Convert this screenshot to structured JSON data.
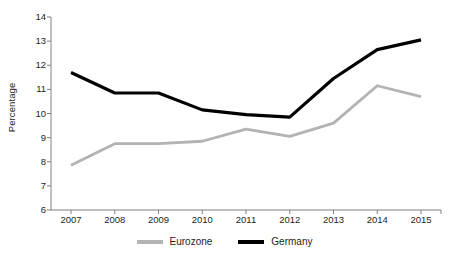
{
  "chart_data": {
    "type": "line",
    "title": "",
    "subtitle": "",
    "xlabel": "",
    "ylabel": "Percentage",
    "categories": [
      "2007",
      "2008",
      "2009",
      "2010",
      "2011",
      "2012",
      "2013",
      "2014",
      "2015"
    ],
    "x": [
      2007,
      2008,
      2009,
      2010,
      2011,
      2012,
      2013,
      2014,
      2015
    ],
    "series": [
      {
        "name": "Eurozone",
        "color": "#b3b3b3",
        "values": [
          7.85,
          8.75,
          8.75,
          8.85,
          9.35,
          9.05,
          9.6,
          11.15,
          10.7
        ]
      },
      {
        "name": "Germany",
        "color": "#000000",
        "values": [
          11.7,
          10.85,
          10.85,
          10.15,
          9.95,
          9.85,
          11.45,
          12.65,
          13.05
        ]
      }
    ],
    "ylim": [
      6,
      14
    ],
    "ytick_labels": [
      "14",
      "13",
      "12",
      "11",
      "10",
      "9",
      "8",
      "7",
      "6"
    ],
    "yticks": [
      14,
      13,
      12,
      11,
      10,
      9,
      8,
      7,
      6
    ],
    "grid": false,
    "legend_position": "bottom",
    "axis_color": "#808080"
  },
  "legend": {
    "items": [
      {
        "label": "Eurozone",
        "swatch_name": "legend-swatch-eurozone"
      },
      {
        "label": "Germany",
        "swatch_name": "legend-swatch-germany"
      }
    ]
  }
}
